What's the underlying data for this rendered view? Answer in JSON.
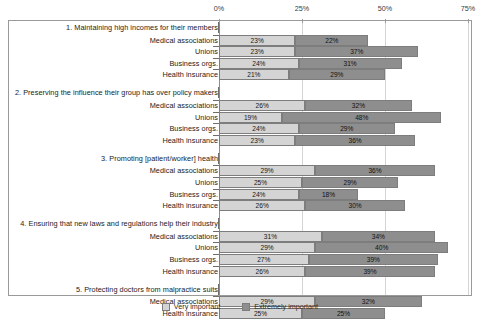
{
  "chart_data": {
    "type": "bar",
    "orientation": "horizontal",
    "stacked": true,
    "title": "",
    "subtitle": "",
    "xlabel": "",
    "ylabel": "",
    "xlim": [
      0,
      75
    ],
    "xticks": [
      0,
      25,
      50,
      75
    ],
    "xtick_labels": [
      "0%",
      "25%",
      "50%",
      "75%"
    ],
    "grid": true,
    "grid_axis": "x",
    "legend_position": "bottom",
    "legend": [
      "Very important",
      "Extremely important"
    ],
    "series": [
      {
        "name": "Very important",
        "color": "#d4d4d4"
      },
      {
        "name": "Extremely important",
        "color": "#8e8e8e"
      }
    ],
    "groups": [
      {
        "label": "1. Maintaining high incomes for their members",
        "rows": [
          {
            "label": "Medical associations",
            "very": 23,
            "extremely": 22,
            "very_label": "23%",
            "extremely_label": "22%"
          },
          {
            "label": "Unions",
            "very": 23,
            "extremely": 37,
            "very_label": "23%",
            "extremely_label": "37%"
          },
          {
            "label": "Business orgs.",
            "very": 24,
            "extremely": 31,
            "very_label": "24%",
            "extremely_label": "31%"
          },
          {
            "label": "Health insurance",
            "very": 21,
            "extremely": 29,
            "very_label": "21%",
            "extremely_label": "29%"
          }
        ]
      },
      {
        "label": "2. Preserving the influence their group has over policy makers",
        "rows": [
          {
            "label": "Medical associations",
            "very": 26,
            "extremely": 32,
            "very_label": "26%",
            "extremely_label": "32%"
          },
          {
            "label": "Unions",
            "very": 19,
            "extremely": 48,
            "very_label": "19%",
            "extremely_label": "48%"
          },
          {
            "label": "Business orgs.",
            "very": 24,
            "extremely": 29,
            "very_label": "24%",
            "extremely_label": "29%"
          },
          {
            "label": "Health insurance",
            "very": 23,
            "extremely": 36,
            "very_label": "23%",
            "extremely_label": "36%"
          }
        ]
      },
      {
        "label": "3. Promoting [patient/worker] health",
        "rows": [
          {
            "label": "Medical associations",
            "very": 29,
            "extremely": 36,
            "very_label": "29%",
            "extremely_label": "36%"
          },
          {
            "label": "Unions",
            "very": 25,
            "extremely": 29,
            "very_label": "25%",
            "extremely_label": "29%"
          },
          {
            "label": "Business orgs.",
            "very": 24,
            "extremely": 18,
            "very_label": "24%",
            "extremely_label": "18%"
          },
          {
            "label": "Health insurance",
            "very": 26,
            "extremely": 30,
            "very_label": "26%",
            "extremely_label": "30%"
          }
        ]
      },
      {
        "label": "4. Ensuring that new laws and regulations help their industry",
        "rows": [
          {
            "label": "Medical associations",
            "very": 31,
            "extremely": 34,
            "very_label": "31%",
            "extremely_label": "34%"
          },
          {
            "label": "Unions",
            "very": 29,
            "extremely": 40,
            "very_label": "29%",
            "extremely_label": "40%"
          },
          {
            "label": "Business orgs.",
            "very": 27,
            "extremely": 39,
            "very_label": "27%",
            "extremely_label": "39%"
          },
          {
            "label": "Health insurance",
            "very": 26,
            "extremely": 39,
            "very_label": "26%",
            "extremely_label": "39%"
          }
        ]
      },
      {
        "label": "5. Protecting doctors from malpractice suits",
        "rows": [
          {
            "label": "Medical associations",
            "very": 29,
            "extremely": 32,
            "very_label": "29%",
            "extremely_label": "32%"
          },
          {
            "label": "Health insurance",
            "very": 25,
            "extremely": 25,
            "very_label": "25%",
            "extremely_label": "25%"
          }
        ]
      }
    ]
  },
  "colors": {
    "very_important": "#d4d4d4",
    "extremely_important": "#8e8e8e",
    "bar_border": "#7d7d7d",
    "gridline": "#d4d4d4",
    "axis": "#8c8c8c",
    "frame": "#9a9a9a",
    "text": "#1b1b1b",
    "background": "#ffffff"
  }
}
